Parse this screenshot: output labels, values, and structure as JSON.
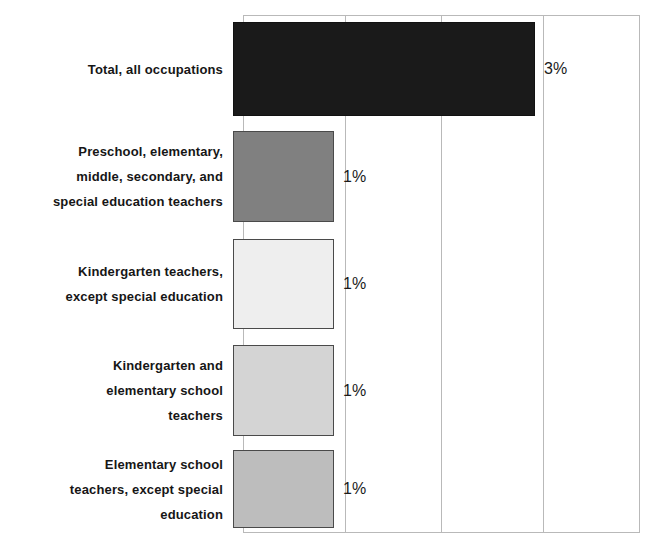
{
  "chart_data": {
    "type": "bar",
    "orientation": "horizontal",
    "title": "",
    "xlabel": "",
    "ylabel": "",
    "grid": true,
    "legend": "none",
    "xlim": [
      0,
      4
    ],
    "xticks": [
      0,
      1,
      2,
      3,
      4
    ],
    "categories": [
      "Total, all occupations",
      "Preschool, elementary, middle, secondary, and special education teachers",
      "Kindergarten teachers, except special education",
      "Kindergarten and elementary school teachers",
      "Elementary school teachers, except special education"
    ],
    "values": [
      3,
      1,
      1,
      1,
      1
    ],
    "value_labels": [
      "3%",
      "1%",
      "1%",
      "1%",
      "1%"
    ],
    "bar_colors": [
      "#1a1a1a",
      "#808080",
      "#eeeeee",
      "#d4d4d4",
      "#bdbdbd"
    ]
  },
  "bars": [
    {
      "label_lines": [
        "Total, all occupations"
      ],
      "value": 3,
      "value_label": "3%",
      "color": "#1a1a1a"
    },
    {
      "label_lines": [
        "Preschool, elementary,",
        "middle, secondary, and",
        "special education teachers"
      ],
      "value": 1,
      "value_label": "1%",
      "color": "#808080"
    },
    {
      "label_lines": [
        "Kindergarten teachers,",
        "except special education"
      ],
      "value": 1,
      "value_label": "1%",
      "color": "#eeeeee"
    },
    {
      "label_lines": [
        "Kindergarten and",
        "elementary school",
        "teachers"
      ],
      "value": 1,
      "value_label": "1%",
      "color": "#d4d4d4"
    },
    {
      "label_lines": [
        "Elementary school",
        "teachers, except special",
        "education"
      ],
      "value": 1,
      "value_label": "1%",
      "color": "#bdbdbd"
    }
  ]
}
